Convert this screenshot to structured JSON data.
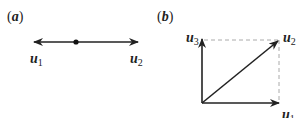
{
  "panel_a": {
    "label_open": "(",
    "label_letter": "a",
    "label_close": ")",
    "vectors": [
      {
        "name": "u",
        "subscript": "1",
        "direction": "left"
      },
      {
        "name": "u",
        "subscript": "2",
        "direction": "right"
      }
    ]
  },
  "panel_b": {
    "label_open": "(",
    "label_letter": "b",
    "label_close": ")",
    "vectors": [
      {
        "name": "u",
        "subscript": "1",
        "direction": "right"
      },
      {
        "name": "u",
        "subscript": "2",
        "direction": "diagonal"
      },
      {
        "name": "u",
        "subscript": "3",
        "direction": "up"
      }
    ]
  },
  "colors": {
    "stroke": "#222222",
    "dashed": "#aaaaaa"
  }
}
